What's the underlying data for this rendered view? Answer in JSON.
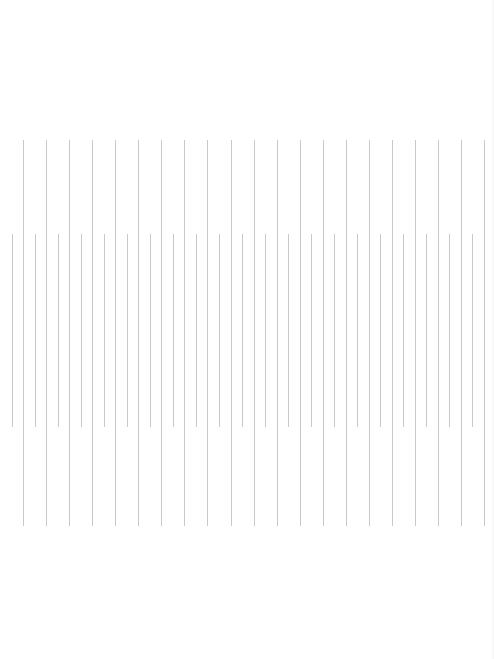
{
  "canvas": {
    "width": 494,
    "height": 659,
    "background": "#ffffff"
  },
  "line_color": "#c9c9c9",
  "upper_set": {
    "count": 21,
    "x_start": 23,
    "spacing": 23.06,
    "y_top": 140,
    "y_bottom": 526
  },
  "lower_set": {
    "count": 21,
    "x_start": 11.5,
    "spacing": 23.04,
    "y_top": 234,
    "y_bottom": 427
  }
}
